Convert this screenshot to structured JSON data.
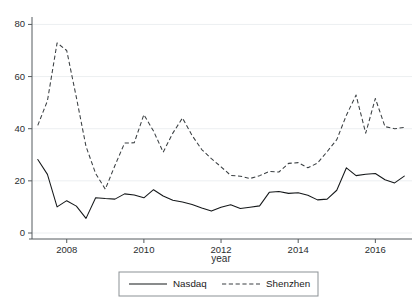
{
  "chart_data": {
    "type": "line",
    "title": "",
    "xlabel": "year",
    "ylabel": "",
    "xlim": [
      2007.1,
      2016.95
    ],
    "ylim": [
      0,
      84
    ],
    "grid": true,
    "grid_axis": "y",
    "legend_position": "bottom",
    "xticks": [
      2008,
      2010,
      2012,
      2014,
      2016
    ],
    "xtick_labels": [
      "2008",
      "2010",
      "2012",
      "2014",
      "2016"
    ],
    "yticks": [
      0,
      20,
      40,
      60,
      80
    ],
    "ytick_labels": [
      "0",
      "20",
      "40",
      "60",
      "80"
    ],
    "x": [
      2007.25,
      2007.5,
      2007.75,
      2008.0,
      2008.25,
      2008.5,
      2008.75,
      2009.0,
      2009.25,
      2009.5,
      2009.75,
      2010.0,
      2010.25,
      2010.5,
      2010.75,
      2011.0,
      2011.25,
      2011.5,
      2011.75,
      2012.0,
      2012.25,
      2012.5,
      2012.75,
      2013.0,
      2013.25,
      2013.5,
      2013.75,
      2014.0,
      2014.25,
      2014.5,
      2014.75,
      2015.0,
      2015.25,
      2015.5,
      2015.75,
      2016.0,
      2016.25,
      2016.5,
      2016.75
    ],
    "series": [
      {
        "name": "Nasdaq",
        "style": "solid",
        "color": "#15181a",
        "values": [
          28.2,
          22.5,
          10.0,
          12.4,
          10.3,
          5.6,
          13.5,
          13.2,
          13.0,
          15.0,
          14.6,
          13.5,
          16.6,
          14.2,
          12.6,
          11.9,
          10.9,
          9.6,
          8.4,
          9.9,
          10.8,
          9.4,
          9.9,
          10.4,
          15.6,
          15.9,
          15.2,
          15.4,
          14.5,
          12.7,
          13.0,
          16.4,
          25.0,
          22.0,
          22.5,
          22.8,
          20.4,
          19.2,
          21.8
        ]
      },
      {
        "name": "Shenzhen",
        "style": "dashed",
        "color": "#3a3f42",
        "values": [
          41.3,
          50.7,
          72.9,
          70.0,
          52.0,
          33.2,
          22.8,
          16.8,
          25.9,
          34.5,
          34.6,
          45.4,
          39.1,
          31.0,
          38.3,
          44.1,
          37.4,
          32.0,
          28.5,
          25.4,
          22.1,
          21.8,
          20.9,
          22.0,
          23.6,
          23.4,
          26.7,
          27.0,
          25.0,
          26.8,
          31.2,
          35.8,
          45.2,
          52.9,
          38.3,
          51.6,
          40.8,
          40.0,
          40.5
        ]
      }
    ]
  },
  "legend": {
    "items": [
      {
        "label": "Nasdaq",
        "style": "solid"
      },
      {
        "label": "Shenzhen",
        "style": "dashed"
      }
    ]
  }
}
